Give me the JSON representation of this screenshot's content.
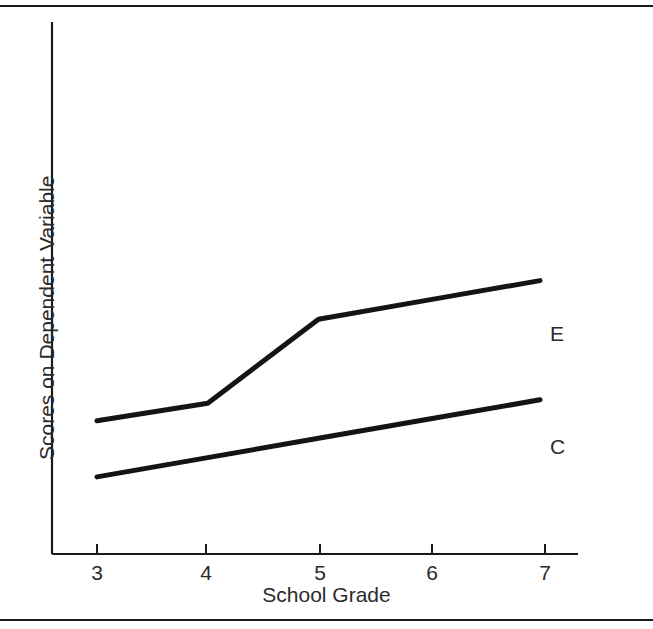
{
  "figure": {
    "background_color": "#ffffff",
    "line_color": "#1a1a1a",
    "text_color": "#2b2b2b",
    "top_rule": "horizontal-rule",
    "bottom_rule": "horizontal-rule"
  },
  "chart_data": {
    "type": "line",
    "title": "",
    "subtitle": "",
    "xlabel": "School Grade",
    "ylabel": "Scores on Dependent Variable",
    "categories": [
      "3",
      "4",
      "5",
      "6",
      "7"
    ],
    "x": [
      3,
      4,
      5,
      6,
      7
    ],
    "xlim": [
      2.6,
      7.3
    ],
    "ylim": [
      0,
      100
    ],
    "grid": false,
    "y_tick_labels": [],
    "legend_position": "right-of-line-ends",
    "annotations": [
      "E",
      "C"
    ],
    "series": [
      {
        "name": "E",
        "label": "E",
        "label_x": 7.25,
        "values": [
          38,
          43,
          67,
          72.5,
          78
        ]
      },
      {
        "name": "C",
        "label": "C",
        "label_x": 7.25,
        "values": [
          22,
          27.5,
          33,
          38.5,
          44
        ]
      }
    ]
  },
  "axes": {
    "x_ticks": [
      {
        "label": "3"
      },
      {
        "label": "4"
      },
      {
        "label": "5"
      },
      {
        "label": "6"
      },
      {
        "label": "7"
      }
    ],
    "x_title": "School Grade",
    "y_title": "Scores on Dependent Variable"
  },
  "labels": {
    "experimental": "E",
    "control": "C"
  }
}
